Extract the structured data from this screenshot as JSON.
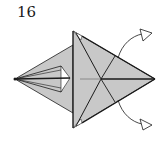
{
  "diagram": {
    "step_number": "16",
    "colors": {
      "paper": "#c8c8c8",
      "line": "#1a1a1a",
      "background": "#ffffff",
      "arrow_head": "#ffffff"
    },
    "arrows": [
      {
        "name": "fold-arrow-up",
        "direction": "up-right"
      },
      {
        "name": "fold-arrow-down",
        "direction": "down-right"
      }
    ]
  }
}
